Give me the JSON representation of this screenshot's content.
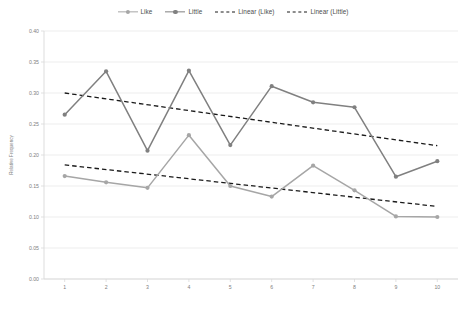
{
  "chart_data": {
    "type": "line",
    "title": "",
    "xlabel": "",
    "ylabel": "Relative Frequency",
    "x": [
      1,
      2,
      3,
      4,
      5,
      6,
      7,
      8,
      9,
      10
    ],
    "xtick_labels": [
      "1",
      "2",
      "3",
      "4",
      "5",
      "6",
      "7",
      "8",
      "9",
      "10"
    ],
    "ytick_labels": [
      "0.00",
      "0.05",
      "0.10",
      "0.15",
      "0.20",
      "0.25",
      "0.30",
      "0.35",
      "0.40"
    ],
    "ytick_values": [
      0.0,
      0.05,
      0.1,
      0.15,
      0.2,
      0.25,
      0.3,
      0.35,
      0.4
    ],
    "ylim": [
      0.0,
      0.4
    ],
    "xlim": [
      0.5,
      10.5
    ],
    "grid": "horizontal",
    "legend_position": "top-center",
    "series": [
      {
        "name": "Like",
        "style": "solid-markers",
        "color": "#a6a6a6",
        "values": [
          0.166,
          0.156,
          0.147,
          0.232,
          0.15,
          0.133,
          0.183,
          0.143,
          0.101,
          0.1
        ]
      },
      {
        "name": "Little",
        "style": "solid-markers",
        "color": "#808080",
        "values": [
          0.265,
          0.335,
          0.207,
          0.336,
          0.216,
          0.311,
          0.285,
          0.277,
          0.165,
          0.19
        ]
      },
      {
        "name": "Linear (Like)",
        "style": "dashed",
        "color": "#1a1a1a",
        "endpoints": [
          0.184,
          0.117
        ]
      },
      {
        "name": "Linear (Little)",
        "style": "dashed",
        "color": "#1a1a1a",
        "endpoints": [
          0.3,
          0.215
        ]
      }
    ],
    "legend": [
      {
        "label": "Like",
        "color": "#a6a6a6",
        "style": "solid-markers"
      },
      {
        "label": "Little",
        "color": "#808080",
        "style": "solid-markers"
      },
      {
        "label": "Linear (Like)",
        "color": "#1a1a1a",
        "style": "dashed"
      },
      {
        "label": "Linear (Little)",
        "color": "#1a1a1a",
        "style": "dashed"
      }
    ]
  },
  "colors": {
    "like": "#a6a6a6",
    "little": "#808080",
    "trend": "#1a1a1a",
    "grid": "#e8e8e8",
    "axis": "#d9d9d9",
    "tick_text": "#808080",
    "background": "#ffffff"
  },
  "caption": {
    "text": ""
  }
}
